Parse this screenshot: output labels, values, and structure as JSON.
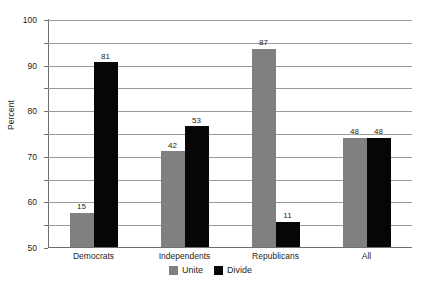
{
  "chart_data": {
    "type": "bar",
    "title": "",
    "xlabel": "",
    "ylabel": "Percent",
    "ylim": [
      0,
      100
    ],
    "ytick_step": 10,
    "yticks": [
      100,
      90,
      80,
      70,
      60,
      50,
      40,
      30,
      20,
      10,
      0
    ],
    "grid": true,
    "legend_position": "bottom-center",
    "categories": [
      "Democrats",
      "Independents",
      "Republicans",
      "All"
    ],
    "series": [
      {
        "name": "Unite",
        "color": "#808080",
        "values": [
          15,
          42,
          87,
          48
        ]
      },
      {
        "name": "Divide",
        "color": "#060606",
        "values": [
          81,
          53,
          11,
          48
        ]
      }
    ],
    "data_labels": {
      "Democrats": {
        "Unite": "15",
        "Divide": "81"
      },
      "Independents": {
        "Unite": "42",
        "Divide": "53"
      },
      "Republicans": {
        "Unite": "87",
        "Divide": "11"
      },
      "All": {
        "Unite": "48",
        "Divide": "48"
      }
    }
  },
  "axis": {
    "y_title": "Percent",
    "y_tick_labels": [
      "100",
      "90",
      "80",
      "70",
      "60",
      "50",
      "40",
      "30",
      "20",
      "10",
      "0"
    ]
  },
  "legend": {
    "items": [
      {
        "label": "Unite",
        "swatch": "gray-swatch-icon"
      },
      {
        "label": "Divide",
        "swatch": "black-swatch-icon"
      }
    ]
  },
  "title_remnant": ""
}
